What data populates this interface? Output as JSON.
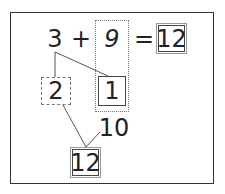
{
  "problem": {
    "addend_1": "3",
    "operator": "+",
    "addend_2": "9",
    "equals": "=",
    "answer": "12"
  },
  "decomposition": {
    "split_part_a": "2",
    "split_part_b": "1",
    "make_ten": "10",
    "result": "12"
  },
  "colors": {
    "line": "#555555",
    "text": "#222222",
    "frame": "#333333"
  }
}
